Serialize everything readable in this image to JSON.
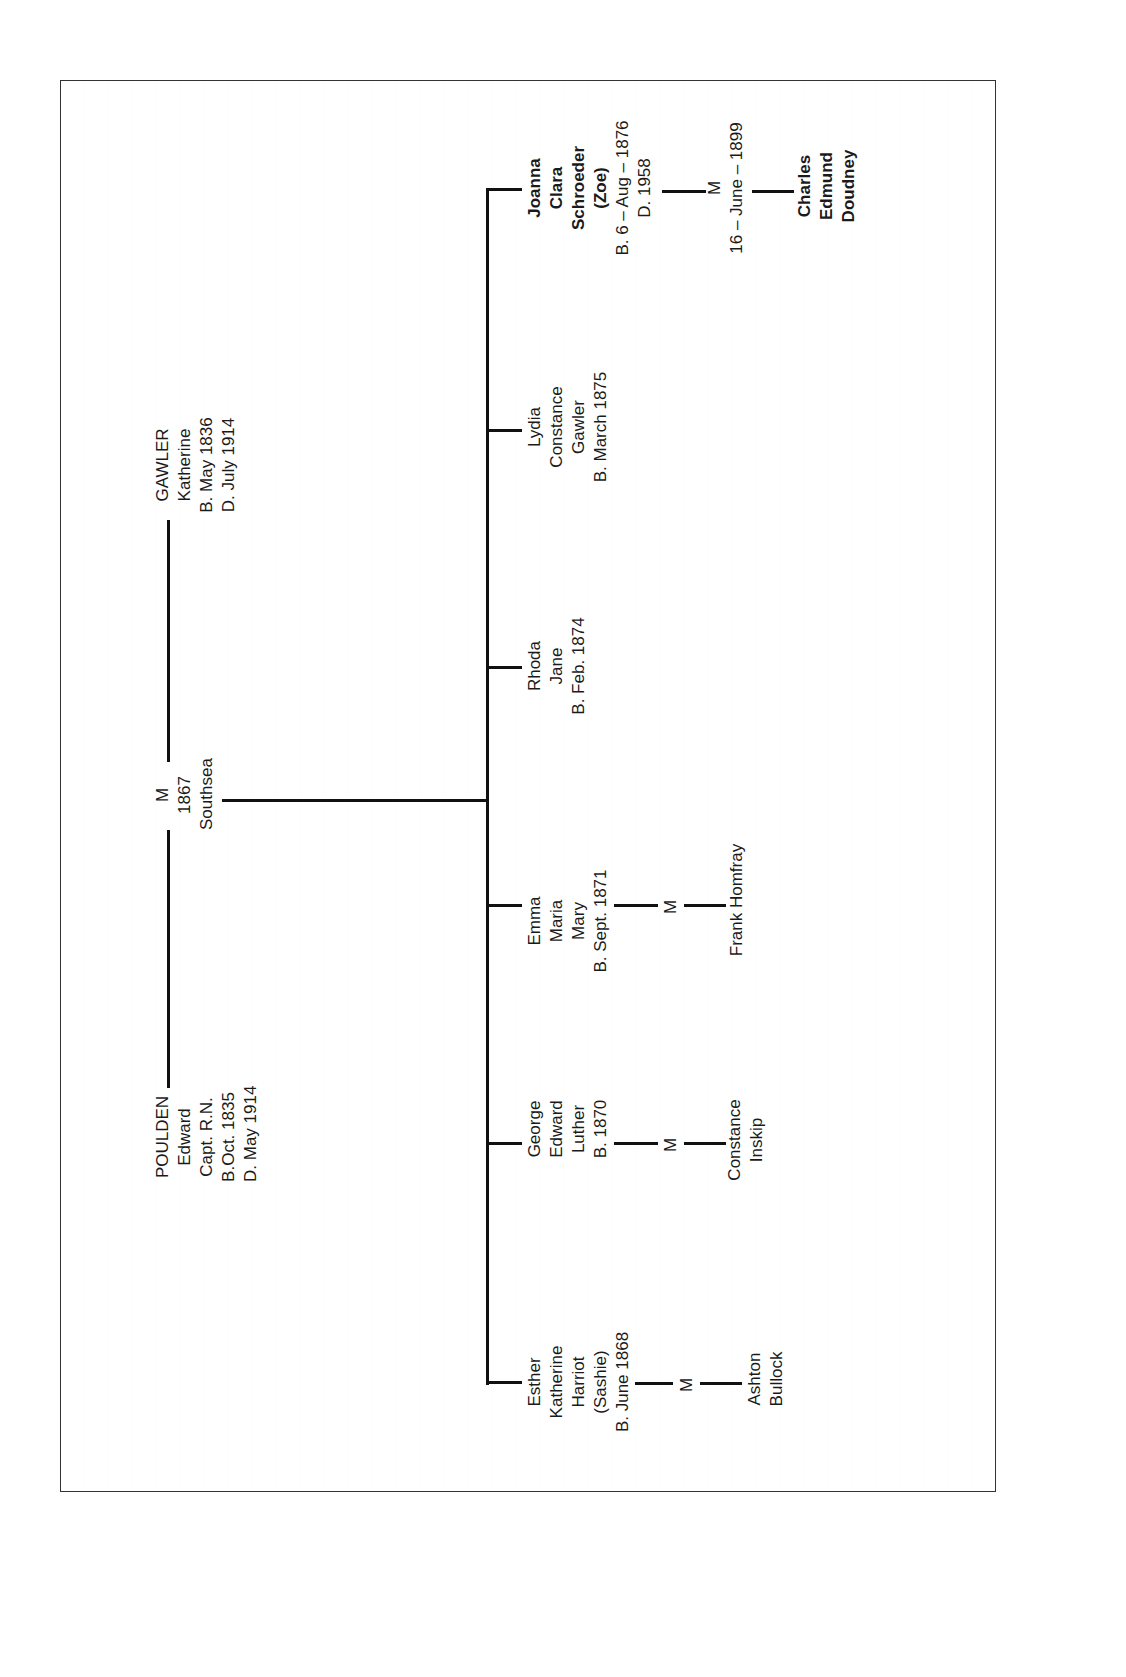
{
  "diagram": {
    "type": "family-tree",
    "orientation": "rotated-90-ccw",
    "parents": {
      "father": {
        "surname": "POULDEN",
        "given": "Edward",
        "title": "Capt. R.N.",
        "born": "B.Oct. 1835",
        "died": "D. May 1914"
      },
      "marriage": {
        "label": "M",
        "year": "1867",
        "place": "Southsea"
      },
      "mother": {
        "surname": "GAWLER",
        "given": "Katherine",
        "born": "B. May 1836",
        "died": "D. July 1914"
      }
    },
    "children": [
      {
        "lines": [
          "Esther",
          "Katherine",
          "Harriot",
          "(Sashie)",
          "B. June 1868"
        ],
        "marriage_label": "M",
        "spouse": [
          "Ashton",
          "Bullock"
        ]
      },
      {
        "lines": [
          "George",
          "Edward",
          "Luther",
          "B. 1870"
        ],
        "marriage_label": "M",
        "spouse": [
          "Constance",
          "Inskip"
        ]
      },
      {
        "lines": [
          "Emma",
          "Maria",
          "Mary",
          "B. Sept. 1871"
        ],
        "marriage_label": "M",
        "spouse": [
          "Frank Homfray"
        ]
      },
      {
        "lines": [
          "Rhoda",
          "Jane",
          "B. Feb. 1874"
        ]
      },
      {
        "lines": [
          "Lydia",
          "Constance",
          "Gawler",
          "B. March 1875"
        ]
      },
      {
        "lines_bold": [
          "Joanna",
          "Clara",
          "Schroeder",
          "(Zoe)"
        ],
        "lines": [
          "B. 6 – Aug – 1876",
          "D. 1958"
        ],
        "marriage_label": "M",
        "marriage_date": "16 – June – 1899",
        "spouse_bold": [
          "Charles",
          "Edmund",
          "Doudney"
        ]
      }
    ]
  }
}
